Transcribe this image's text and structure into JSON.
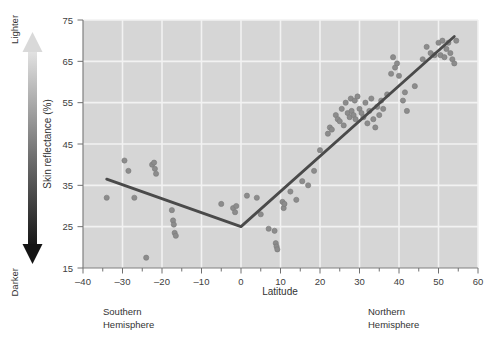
{
  "chart_data": {
    "type": "scatter",
    "title": "",
    "xlabel": "Latitude",
    "ylabel": "Skin reflectance (%)",
    "xlim": [
      -40,
      60
    ],
    "ylim": [
      15,
      75
    ],
    "xticks": [
      -40,
      -30,
      -20,
      -10,
      0,
      10,
      20,
      30,
      40,
      50,
      60
    ],
    "xtick_labels": [
      "–40",
      "–30",
      "–20",
      "–10",
      "0",
      "10",
      "20",
      "30",
      "40",
      "50",
      "60"
    ],
    "yticks": [
      15,
      25,
      35,
      45,
      55,
      65,
      75
    ],
    "ytick_labels": [
      "15",
      "25",
      "35",
      "45",
      "55",
      "65",
      "75"
    ],
    "xminor_step": 5,
    "grid": "horizontal-and-vertical-white-on-gray",
    "legend": "none",
    "plot_bgcolor": "#d6d6d6",
    "gridcolor": "#f2f2f2",
    "point_color": "#8c8c8c",
    "point_edge_color": "#7a7a7a",
    "line_color": "#4a4a4a",
    "point_radius": 2.6,
    "line_width": 2.8,
    "points": [
      [
        -34.0,
        32.0
      ],
      [
        -29.5,
        41.0
      ],
      [
        -28.5,
        38.5
      ],
      [
        -27.0,
        32.0
      ],
      [
        -24.0,
        17.5
      ],
      [
        -22.5,
        40.0
      ],
      [
        -22.0,
        40.5
      ],
      [
        -21.8,
        39.0
      ],
      [
        -21.5,
        37.8
      ],
      [
        -17.5,
        29.0
      ],
      [
        -17.2,
        26.5
      ],
      [
        -17.0,
        25.5
      ],
      [
        -16.8,
        23.5
      ],
      [
        -16.5,
        22.8
      ],
      [
        -5.0,
        30.5
      ],
      [
        -2.0,
        29.5
      ],
      [
        -1.5,
        28.5
      ],
      [
        -1.2,
        30.0
      ],
      [
        1.5,
        32.5
      ],
      [
        4.0,
        32.0
      ],
      [
        5.0,
        28.0
      ],
      [
        7.0,
        24.5
      ],
      [
        8.5,
        24.0
      ],
      [
        8.8,
        21.0
      ],
      [
        9.0,
        20.2
      ],
      [
        9.2,
        19.5
      ],
      [
        10.5,
        31.0
      ],
      [
        10.8,
        29.5
      ],
      [
        11.0,
        30.5
      ],
      [
        12.5,
        33.5
      ],
      [
        14.0,
        31.5
      ],
      [
        15.5,
        36.0
      ],
      [
        17.0,
        35.0
      ],
      [
        18.5,
        38.5
      ],
      [
        20.0,
        43.5
      ],
      [
        22.0,
        47.5
      ],
      [
        22.5,
        49.0
      ],
      [
        23.0,
        48.5
      ],
      [
        24.0,
        52.0
      ],
      [
        24.5,
        51.0
      ],
      [
        25.0,
        50.5
      ],
      [
        25.5,
        53.5
      ],
      [
        26.0,
        49.5
      ],
      [
        26.5,
        55.0
      ],
      [
        27.0,
        52.5
      ],
      [
        27.5,
        51.5
      ],
      [
        27.8,
        56.0
      ],
      [
        28.0,
        53.0
      ],
      [
        28.5,
        52.0
      ],
      [
        28.8,
        55.5
      ],
      [
        29.0,
        51.0
      ],
      [
        29.5,
        56.5
      ],
      [
        30.0,
        53.5
      ],
      [
        30.5,
        52.5
      ],
      [
        31.0,
        51.5
      ],
      [
        31.5,
        55.0
      ],
      [
        32.0,
        50.0
      ],
      [
        32.5,
        53.0
      ],
      [
        33.0,
        56.0
      ],
      [
        33.5,
        51.0
      ],
      [
        34.0,
        49.0
      ],
      [
        34.5,
        54.0
      ],
      [
        35.0,
        52.0
      ],
      [
        35.5,
        55.5
      ],
      [
        36.0,
        53.5
      ],
      [
        37.0,
        57.0
      ],
      [
        38.0,
        62.0
      ],
      [
        38.5,
        66.0
      ],
      [
        39.0,
        63.5
      ],
      [
        39.5,
        64.5
      ],
      [
        40.0,
        61.5
      ],
      [
        41.0,
        55.5
      ],
      [
        41.5,
        57.5
      ],
      [
        42.0,
        53.0
      ],
      [
        44.0,
        59.0
      ],
      [
        46.0,
        65.5
      ],
      [
        47.0,
        68.5
      ],
      [
        48.0,
        67.0
      ],
      [
        49.0,
        66.5
      ],
      [
        50.0,
        69.5
      ],
      [
        50.5,
        66.5
      ],
      [
        51.0,
        70.0
      ],
      [
        51.5,
        66.0
      ],
      [
        52.0,
        68.0
      ],
      [
        52.5,
        69.5
      ],
      [
        53.0,
        67.0
      ],
      [
        53.5,
        65.5
      ],
      [
        54.0,
        64.5
      ],
      [
        54.5,
        70.0
      ]
    ],
    "trend_line": {
      "description": "piecewise V-shaped fit with vertex near the equator",
      "vertices": [
        [
          -34.0,
          36.5
        ],
        [
          0.0,
          25.0
        ],
        [
          54.0,
          71.0
        ]
      ]
    },
    "annotations": [
      {
        "name": "southern-hemisphere",
        "line1": "Southern",
        "line2": "Hemisphere"
      },
      {
        "name": "northern-hemisphere",
        "line1": "Northern",
        "line2": "Hemisphere"
      }
    ],
    "gradient_arrow": {
      "top_label": "Lighter",
      "bottom_label": "Darker",
      "top_color": "#e2e2e2",
      "bottom_color": "#1a1a1a",
      "double_headed": true
    }
  }
}
